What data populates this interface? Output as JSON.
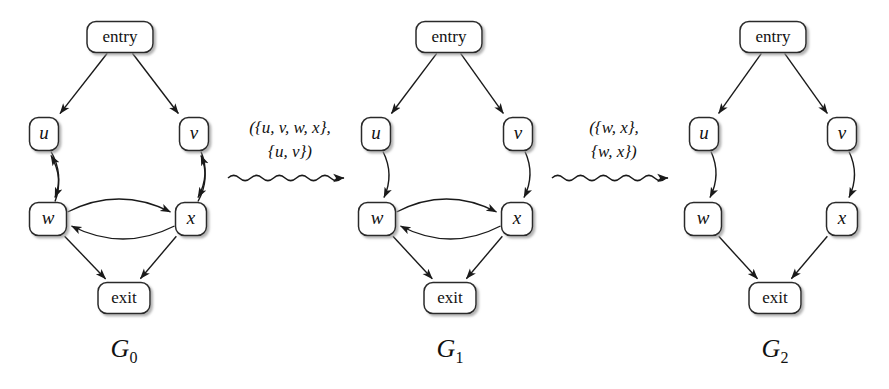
{
  "figure": {
    "background_color": "#ffffff",
    "line_color": "#1a1a1a",
    "node_fill": "#ffffff",
    "node_stroke": "#2b2b2b"
  },
  "graphs": [
    {
      "id": "G0",
      "name": "G",
      "subscript": "0",
      "nodes": [
        {
          "key": "entry",
          "label": "entry",
          "kind": "word",
          "cx": 120,
          "cy": 37,
          "w": 66,
          "h": 31
        },
        {
          "key": "u",
          "label": "u",
          "kind": "var",
          "cx": 44,
          "cy": 134,
          "w": 29,
          "h": 33
        },
        {
          "key": "v",
          "label": "v",
          "kind": "var",
          "cx": 194,
          "cy": 134,
          "w": 29,
          "h": 33
        },
        {
          "key": "w",
          "label": "w",
          "kind": "var",
          "cx": 48,
          "cy": 219,
          "w": 37,
          "h": 33
        },
        {
          "key": "x",
          "label": "x",
          "kind": "var",
          "cx": 191,
          "cy": 219,
          "w": 31,
          "h": 33
        },
        {
          "key": "exit",
          "label": "exit",
          "kind": "word",
          "cx": 124,
          "cy": 298,
          "w": 52,
          "h": 31
        }
      ],
      "edges": [
        {
          "from": "entry",
          "to": "u",
          "style": "straight"
        },
        {
          "from": "entry",
          "to": "v",
          "style": "straight"
        },
        {
          "from": "u",
          "to": "w",
          "style": "curve-right"
        },
        {
          "from": "w",
          "to": "u",
          "style": "curve-right"
        },
        {
          "from": "v",
          "to": "x",
          "style": "curve-right"
        },
        {
          "from": "x",
          "to": "v",
          "style": "curve-right"
        },
        {
          "from": "w",
          "to": "x",
          "style": "curve-up"
        },
        {
          "from": "x",
          "to": "w",
          "style": "curve-down"
        },
        {
          "from": "w",
          "to": "exit",
          "style": "straight"
        },
        {
          "from": "x",
          "to": "exit",
          "style": "straight"
        }
      ],
      "name_pos": {
        "x": 124,
        "y": 357
      }
    },
    {
      "id": "G1",
      "name": "G",
      "subscript": "1",
      "nodes": [
        {
          "key": "entry",
          "label": "entry",
          "cx": 449,
          "cy": 37,
          "kind": "word",
          "w": 66,
          "h": 31
        },
        {
          "key": "u",
          "label": "u",
          "kind": "var",
          "cx": 376,
          "cy": 134,
          "w": 29,
          "h": 33
        },
        {
          "key": "v",
          "label": "v",
          "kind": "var",
          "cx": 518,
          "cy": 134,
          "w": 29,
          "h": 33
        },
        {
          "key": "w",
          "label": "w",
          "kind": "var",
          "cx": 377,
          "cy": 219,
          "w": 37,
          "h": 33
        },
        {
          "key": "x",
          "label": "x",
          "kind": "var",
          "cx": 517,
          "cy": 219,
          "w": 31,
          "h": 33
        },
        {
          "key": "exit",
          "label": "exit",
          "kind": "word",
          "cx": 450,
          "cy": 298,
          "w": 52,
          "h": 31
        }
      ],
      "edges": [
        {
          "from": "entry",
          "to": "u",
          "style": "straight"
        },
        {
          "from": "entry",
          "to": "v",
          "style": "straight"
        },
        {
          "from": "u",
          "to": "w",
          "style": "curve-right"
        },
        {
          "from": "v",
          "to": "x",
          "style": "curve-right"
        },
        {
          "from": "w",
          "to": "x",
          "style": "curve-up"
        },
        {
          "from": "x",
          "to": "w",
          "style": "curve-down"
        },
        {
          "from": "w",
          "to": "exit",
          "style": "straight"
        },
        {
          "from": "x",
          "to": "exit",
          "style": "straight"
        }
      ],
      "name_pos": {
        "x": 450,
        "y": 357
      }
    },
    {
      "id": "G2",
      "name": "G",
      "subscript": "2",
      "nodes": [
        {
          "key": "entry",
          "label": "entry",
          "kind": "word",
          "cx": 773,
          "cy": 37,
          "w": 66,
          "h": 31
        },
        {
          "key": "u",
          "label": "u",
          "kind": "var",
          "cx": 704,
          "cy": 134,
          "w": 29,
          "h": 33
        },
        {
          "key": "v",
          "label": "v",
          "kind": "var",
          "cx": 842,
          "cy": 134,
          "w": 29,
          "h": 33
        },
        {
          "key": "w",
          "label": "w",
          "kind": "var",
          "cx": 703,
          "cy": 219,
          "w": 37,
          "h": 33
        },
        {
          "key": "x",
          "label": "x",
          "kind": "var",
          "cx": 842,
          "cy": 219,
          "w": 31,
          "h": 33
        },
        {
          "key": "exit",
          "label": "exit",
          "kind": "word",
          "cx": 775,
          "cy": 298,
          "w": 52,
          "h": 31
        }
      ],
      "edges": [
        {
          "from": "entry",
          "to": "u",
          "style": "straight"
        },
        {
          "from": "entry",
          "to": "v",
          "style": "straight"
        },
        {
          "from": "u",
          "to": "w",
          "style": "curve-right"
        },
        {
          "from": "v",
          "to": "x",
          "style": "curve-right"
        },
        {
          "from": "w",
          "to": "exit",
          "style": "straight"
        },
        {
          "from": "x",
          "to": "exit",
          "style": "straight"
        }
      ],
      "name_pos": {
        "x": 775,
        "y": 357
      }
    }
  ],
  "transitions": [
    {
      "id": "t0",
      "from_graph": "G0",
      "to_graph": "G1",
      "line1": "({u, v, w, x},",
      "line2": "{u, v})",
      "label_x": 290,
      "label_y1": 133,
      "label_y2": 157,
      "arrow_x1": 228,
      "arrow_x2": 353,
      "arrow_y": 178
    },
    {
      "id": "t1",
      "from_graph": "G1",
      "to_graph": "G2",
      "line1": "({w, x},",
      "line2": "{w, x})",
      "label_x": 614,
      "label_y1": 133,
      "label_y2": 157,
      "arrow_x1": 552,
      "arrow_x2": 677,
      "arrow_y": 178
    }
  ]
}
